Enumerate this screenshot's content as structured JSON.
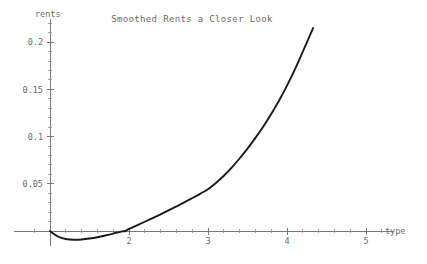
{
  "chart_data": {
    "type": "line",
    "title": "Smoothed Rents a Closer Look",
    "xlabel": "type",
    "ylabel": "rents",
    "xlim": [
      0.55,
      5.35
    ],
    "ylim": [
      -0.016,
      0.225
    ],
    "grid": false,
    "legend": null,
    "x_ticks": [
      2,
      3,
      4,
      5
    ],
    "x_tick_labels": [
      "2",
      "3",
      "4",
      "5"
    ],
    "x_minor_ticks": [
      0.8,
      1.0,
      1.2,
      1.4,
      1.6,
      1.8,
      2.2,
      2.4,
      2.6,
      2.8,
      3.2,
      3.4,
      3.6,
      3.8,
      4.2,
      4.4,
      4.6,
      4.8,
      5.2
    ],
    "y_ticks": [
      0.05,
      0.1,
      0.15,
      0.2
    ],
    "y_tick_labels": [
      "0.05",
      "0.1",
      "0.15",
      "0.2"
    ],
    "y_minor_ticks": [
      0.01,
      0.02,
      0.03,
      0.04,
      0.06,
      0.07,
      0.08,
      0.09,
      0.11,
      0.12,
      0.13,
      0.14,
      0.16,
      0.17,
      0.18,
      0.19,
      0.21,
      0.22
    ],
    "series": [
      {
        "name": "smoothed rents",
        "color": "#1a1a1a",
        "x": [
          1.0,
          1.1,
          1.2,
          1.3,
          1.4,
          1.5,
          1.6,
          1.7,
          1.8,
          1.9,
          1.95,
          2.0,
          2.1,
          2.2,
          2.3,
          2.4,
          2.5,
          2.6,
          2.7,
          2.8,
          2.9,
          3.0,
          3.1,
          3.2,
          3.3,
          3.4,
          3.5,
          3.6,
          3.7,
          3.8,
          3.9,
          4.0,
          4.1,
          4.2,
          4.33
        ],
        "y": [
          0.0,
          -0.0058,
          -0.0085,
          -0.0093,
          -0.009,
          -0.008,
          -0.0066,
          -0.0048,
          -0.0028,
          -0.0006,
          0.0,
          0.0022,
          0.006,
          0.0098,
          0.0137,
          0.0177,
          0.0218,
          0.026,
          0.0303,
          0.0348,
          0.0394,
          0.0442,
          0.0508,
          0.0585,
          0.0672,
          0.0768,
          0.0873,
          0.0986,
          0.1108,
          0.124,
          0.1383,
          0.154,
          0.1712,
          0.19,
          0.215
        ]
      }
    ]
  },
  "axis": {
    "x_label": "type",
    "y_label": "rents"
  },
  "title": {
    "text": "Smoothed Rents a Closer Look"
  }
}
